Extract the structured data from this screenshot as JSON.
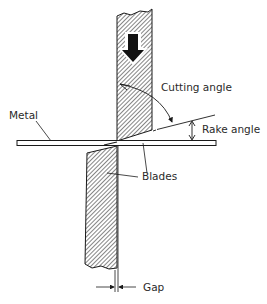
{
  "figure": {
    "labels": {
      "cutting_angle": "Cutting angle",
      "rake_angle": "Rake angle",
      "metal": "Metal",
      "blades": "Blades",
      "gap": "Gap"
    },
    "direction_arrow": "down-arrow-icon",
    "colors": {
      "ink": "#1a1a1a",
      "hatch": "#333333",
      "background": "#ffffff"
    }
  }
}
